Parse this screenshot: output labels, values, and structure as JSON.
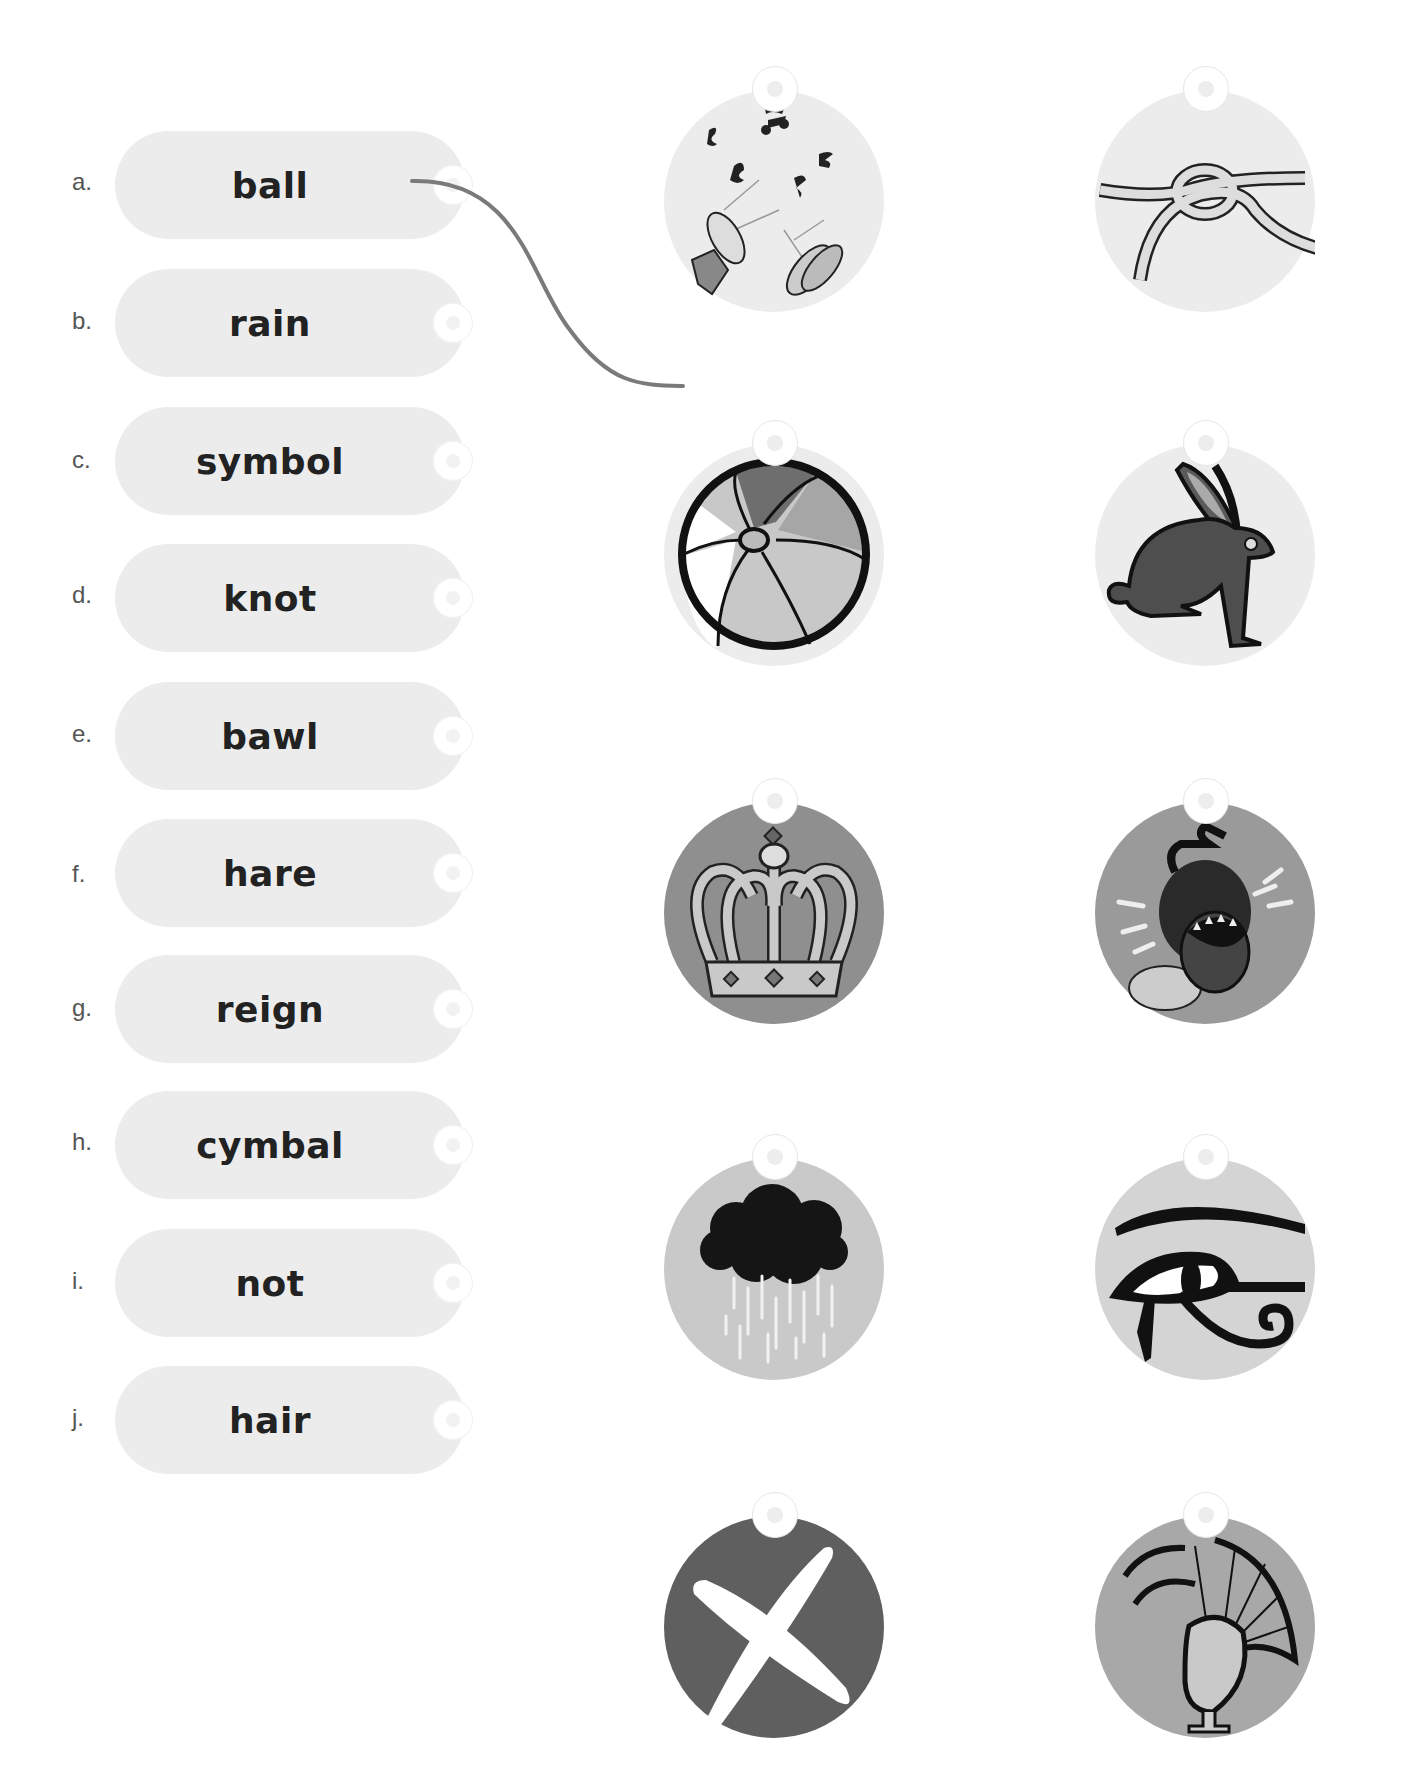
{
  "worksheet": {
    "words": [
      {
        "letter": "a.",
        "word": "ball"
      },
      {
        "letter": "b.",
        "word": "rain"
      },
      {
        "letter": "c.",
        "word": "symbol"
      },
      {
        "letter": "d.",
        "word": "knot"
      },
      {
        "letter": "e.",
        "word": "bawl"
      },
      {
        "letter": "f.",
        "word": "hare"
      },
      {
        "letter": "g.",
        "word": "reign"
      },
      {
        "letter": "h.",
        "word": "cymbal"
      },
      {
        "letter": "i.",
        "word": "not"
      },
      {
        "letter": "j.",
        "word": "hair"
      }
    ],
    "pictures": [
      {
        "name": "instruments-noise",
        "color": "#ececec"
      },
      {
        "name": "rope-knot",
        "color": "#ececec"
      },
      {
        "name": "beach-ball",
        "color": "#ececec"
      },
      {
        "name": "hare",
        "color": "#ececec"
      },
      {
        "name": "crown",
        "color": "#8f8f8f"
      },
      {
        "name": "crying-fly",
        "color": "#9a9a9a"
      },
      {
        "name": "rain-cloud",
        "color": "#c9c9c9"
      },
      {
        "name": "eye-of-horus",
        "color": "#d4d4d4"
      },
      {
        "name": "cross-x",
        "color": "#5f5f5f"
      },
      {
        "name": "hair-wig",
        "color": "#a8a8a8"
      }
    ],
    "connections": [
      {
        "from_word": "ball",
        "to_picture": "beach-ball"
      }
    ],
    "connector_color": "#7a7a7a"
  }
}
